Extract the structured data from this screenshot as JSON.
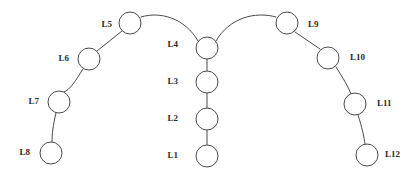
{
  "diagram": {
    "background_color": "#ffffff",
    "stroke_color": "#4a4a4a",
    "label_color": "#2b2b2b",
    "node_fill": "#ffffff",
    "node_radius": 11,
    "stroke_width": 1,
    "width": 415,
    "height": 177,
    "nodes": [
      {
        "id": "L1",
        "label": "L1",
        "cx": 207,
        "cy": 156,
        "r": 11,
        "label_x": 178,
        "label_y": 156,
        "label_side": "left"
      },
      {
        "id": "L2",
        "label": "L2",
        "cx": 207,
        "cy": 119,
        "r": 11,
        "label_x": 178,
        "label_y": 119,
        "label_side": "left"
      },
      {
        "id": "L3",
        "label": "L3",
        "cx": 207,
        "cy": 82,
        "r": 11,
        "label_x": 178,
        "label_y": 82,
        "label_side": "left"
      },
      {
        "id": "L4",
        "label": "L4",
        "cx": 207,
        "cy": 48,
        "r": 11,
        "label_x": 178,
        "label_y": 45,
        "label_side": "left"
      },
      {
        "id": "L5",
        "label": "L5",
        "cx": 130,
        "cy": 23,
        "r": 11,
        "label_x": 112,
        "label_y": 25,
        "label_side": "left"
      },
      {
        "id": "L6",
        "label": "L6",
        "cx": 89,
        "cy": 59,
        "r": 11,
        "label_x": 69,
        "label_y": 59,
        "label_side": "left"
      },
      {
        "id": "L7",
        "label": "L7",
        "cx": 59,
        "cy": 102,
        "r": 11,
        "label_x": 39,
        "label_y": 102,
        "label_side": "left"
      },
      {
        "id": "L8",
        "label": "L8",
        "cx": 51,
        "cy": 153,
        "r": 11,
        "label_x": 30,
        "label_y": 153,
        "label_side": "left"
      },
      {
        "id": "L9",
        "label": "L9",
        "cx": 287,
        "cy": 23,
        "r": 11,
        "label_x": 308,
        "label_y": 25,
        "label_side": "right"
      },
      {
        "id": "L10",
        "label": "L10",
        "cx": 328,
        "cy": 58,
        "r": 11,
        "label_x": 350,
        "label_y": 58,
        "label_side": "right"
      },
      {
        "id": "L11",
        "label": "L11",
        "cx": 355,
        "cy": 104,
        "r": 11,
        "label_x": 377,
        "label_y": 104,
        "label_side": "right"
      },
      {
        "id": "L12",
        "label": "L12",
        "cx": 367,
        "cy": 155,
        "r": 11,
        "label_x": 385,
        "label_y": 155,
        "label_side": "right"
      }
    ],
    "links": [
      {
        "from": "L1",
        "to": "L2",
        "type": "line",
        "path": "M 207 145 L 207 130"
      },
      {
        "from": "L2",
        "to": "L3",
        "type": "line",
        "path": "M 207 108 L 207 93"
      },
      {
        "from": "L3",
        "to": "L4",
        "type": "line",
        "path": "M 207 71 L 207 59"
      },
      {
        "from": "L4",
        "to": "L5",
        "type": "curve",
        "path": "M 198 41 C 185 18 160 11 141 17"
      },
      {
        "from": "L5",
        "to": "L6",
        "type": "line",
        "path": "M 122 31 L 97 51"
      },
      {
        "from": "L6",
        "to": "L7",
        "type": "curve",
        "path": "M 83 69 C 76 80 70 90 64 92"
      },
      {
        "from": "L7",
        "to": "L8",
        "type": "curve",
        "path": "M 56 113 C 53 125 52 134 52 142"
      },
      {
        "from": "L4",
        "to": "L9",
        "type": "curve",
        "path": "M 216 41 C 229 18 255 11 276 17"
      },
      {
        "from": "L9",
        "to": "L10",
        "type": "line",
        "path": "M 295 32 L 320 49"
      },
      {
        "from": "L10",
        "to": "L11",
        "type": "curve",
        "path": "M 336 67 C 343 78 349 88 351 94"
      },
      {
        "from": "L11",
        "to": "L12",
        "type": "curve",
        "path": "M 358 115 C 362 127 364 137 365 144"
      }
    ]
  }
}
